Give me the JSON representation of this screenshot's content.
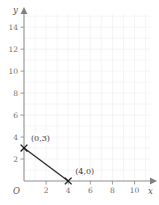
{
  "chart_data": {
    "type": "line",
    "title": "",
    "xlabel": "x",
    "ylabel": "y",
    "xlim": [
      0,
      11.4
    ],
    "ylim": [
      0,
      15.2
    ],
    "grid": true,
    "legend": null,
    "origin_label": "O",
    "x_ticks": [
      2,
      4,
      6,
      8,
      10
    ],
    "y_ticks": [
      2,
      4,
      6,
      8,
      10,
      12,
      14
    ],
    "x_tick_labels": [
      "2",
      "4",
      "6",
      "8",
      "10"
    ],
    "y_tick_labels": [
      "2",
      "4",
      "6",
      "8",
      "10",
      "12",
      "14"
    ],
    "series": [
      {
        "name": "segment",
        "marker": "x",
        "points": [
          {
            "x": 0,
            "y": 3,
            "label": "(0,3)"
          },
          {
            "x": 4,
            "y": 0,
            "label": "(4,0)"
          }
        ]
      }
    ],
    "annotations": [
      {
        "text": "(0,3)",
        "x": 0,
        "y": 3
      },
      {
        "text": "(4,0)",
        "x": 4,
        "y": 0
      }
    ],
    "colors": {
      "line": "#2b2b2b",
      "marker": "#1a1a1a",
      "axis": "#909090",
      "grid": "#f0f0f0",
      "tick_text": "#6e6e6e",
      "label_text": "#3a3a3a",
      "background": "#ffffff"
    }
  }
}
